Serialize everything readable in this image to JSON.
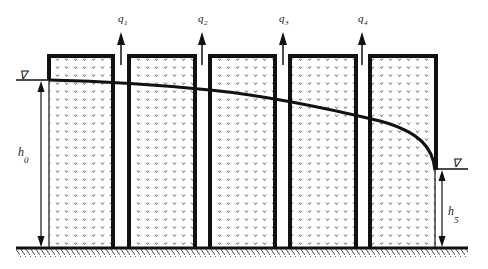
{
  "diagram": {
    "colors": {
      "ink": "#111111",
      "background": "#ffffff",
      "dots": "#555555"
    },
    "flows": [
      {
        "symbol": "q",
        "sub": "1"
      },
      {
        "symbol": "q",
        "sub": "2"
      },
      {
        "symbol": "q",
        "sub": "3"
      },
      {
        "symbol": "q",
        "sub": "4"
      }
    ],
    "upstream": {
      "level_symbol": "∇",
      "height_symbol": "h",
      "height_sub": "0"
    },
    "downstream": {
      "level_symbol": "∇",
      "height_symbol": "h",
      "height_sub": "5"
    },
    "block_count": 5
  }
}
